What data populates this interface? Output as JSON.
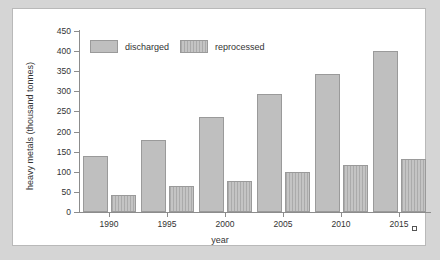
{
  "chart_data": {
    "type": "bar",
    "title": "",
    "xlabel": "year",
    "ylabel": "heavy metals (thousand tonnes)",
    "categories": [
      "1990",
      "1995",
      "2000",
      "2005",
      "2010",
      "2015"
    ],
    "series": [
      {
        "name": "discharged",
        "values": [
          140,
          180,
          235,
          293,
          342,
          400
        ]
      },
      {
        "name": "reprocessed",
        "values": [
          43,
          65,
          78,
          100,
          116,
          133
        ]
      }
    ],
    "ylim": [
      0,
      450
    ],
    "yticks": [
      0,
      50,
      100,
      150,
      200,
      250,
      300,
      350,
      400,
      450
    ],
    "ytick_labels": [
      "0",
      "50",
      "100",
      "150",
      "200",
      "250",
      "300",
      "350",
      "400",
      "450"
    ],
    "grid": false,
    "legend_position": "top-left",
    "legend": [
      "discharged",
      "reprocessed"
    ],
    "colors": {
      "discharged": "#bfbfbf",
      "reprocessed": "#c4c4c4",
      "bar_border": "#9a9a9a",
      "axis": "#8c8c8c",
      "text": "#333333",
      "panel_background": "#ffffff",
      "page_background": "#d5d5d5"
    }
  }
}
